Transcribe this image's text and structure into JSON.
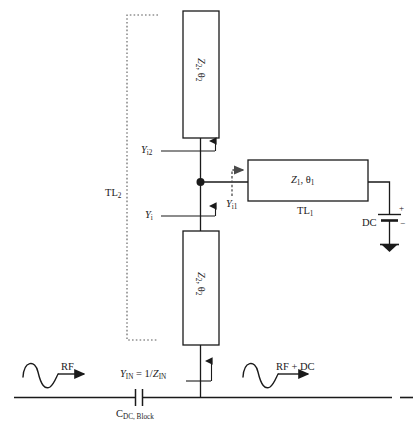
{
  "figure": {
    "type": "circuit-schematic",
    "background_color": "#ffffff",
    "line_color": "#1a1a1a",
    "dotted_color": "#5a5a5a"
  },
  "blocks": {
    "tl2_top": {
      "name": "upper-stub",
      "label_z": "Z",
      "label_z_sub": "2",
      "label_theta": "θ",
      "label_theta_sub": "2",
      "label_full": "Z2, θ2"
    },
    "tl2_bottom": {
      "name": "lower-stub",
      "label_z": "Z",
      "label_z_sub": "2",
      "label_theta": "θ",
      "label_theta_sub": "2",
      "label_full": "Z2, θ2"
    },
    "tl1": {
      "name": "series-line",
      "label_z": "Z",
      "label_z_sub": "1",
      "label_theta": "θ",
      "label_theta_sub": "1",
      "label_full": "Z1, θ1",
      "caption": "TL",
      "caption_sub": "1"
    }
  },
  "labels": {
    "tl2_bracket": {
      "text": "TL",
      "sub": "2"
    },
    "y_i2": {
      "text": "Y",
      "sub": "i2"
    },
    "y_i": {
      "text": "Y",
      "sub": "i"
    },
    "y_i1": {
      "text": "Y",
      "sub": "i1"
    },
    "y_in": {
      "text": "Y",
      "sub": "IN",
      "equals": " = 1/",
      "z": "Z",
      "z_sub": "IN"
    },
    "dc_source": "DC",
    "dc_plus": "+",
    "dc_minus": "−",
    "cap_block": {
      "text": "C",
      "sub": "DC, Block"
    },
    "rf_in": "RF",
    "rf_out": "RF + DC"
  }
}
